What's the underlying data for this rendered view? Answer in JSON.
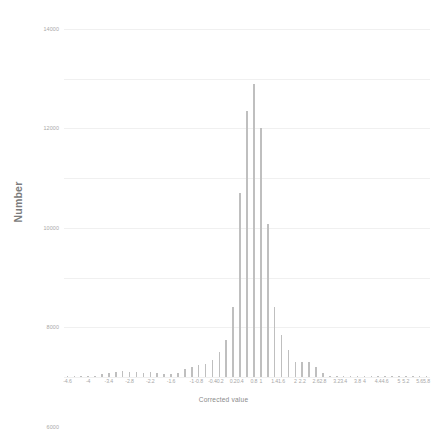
{
  "chart_data": {
    "type": "bar",
    "title": "",
    "subtitle": "",
    "xlabel": "Corrected value",
    "ylabel": "Number",
    "ylim": [
      0,
      14000
    ],
    "ytick_step": 2000,
    "yticks": [
      0,
      2000,
      4000,
      6000,
      8000,
      10000,
      12000,
      14000
    ],
    "ytick_labels": [
      "0",
      "2000",
      "4000",
      "6000",
      "8000",
      "10000",
      "12000",
      "14000"
    ],
    "xlim": [
      -4.6,
      5.8
    ],
    "grid": "horizontal",
    "legend": "none",
    "bar_color": "#bfbfbf",
    "grid_color": "#f0f0f0",
    "axis_text_color": "#a8a8a8",
    "background": "#ffffff",
    "categories": [
      "-4.6",
      "-4.4",
      "-4.2",
      "-4",
      "-3.8",
      "-3.6",
      "-3.4",
      "-3.2",
      "-3",
      "-2.8",
      "-2.6",
      "-2.4",
      "-2.2",
      "-2",
      "-1.8",
      "-1.6",
      "-1.4",
      "-1.2",
      "-1",
      "-0.8",
      "-0.6",
      "-0.4",
      "-0.2",
      "0",
      "0.2",
      "0.4",
      "0.6",
      "0.8",
      "1",
      "1.2",
      "1.4",
      "1.6",
      "1.8",
      "2",
      "2.2",
      "2.4",
      "2.6",
      "2.8",
      "3",
      "3.2",
      "3.4",
      "3.6",
      "3.8",
      "4",
      "4.2",
      "4.4",
      "4.6",
      "4.8",
      "5",
      "5.2",
      "5.4",
      "5.6",
      "5.8"
    ],
    "xtick_labels": [
      "-4.6",
      "",
      "",
      "-4",
      "",
      "",
      "-3.4",
      "",
      "",
      "-2.8",
      "",
      "",
      "-2.2",
      "",
      "",
      "-1.6",
      "",
      "",
      "-1",
      "-0.8",
      "",
      "-0.4",
      "-0.2",
      "",
      "0.2",
      "0.4",
      "",
      "0.8",
      "1",
      "",
      "1.4",
      "1.6",
      "",
      "2",
      "2.2",
      "",
      "2.6",
      "2.8",
      "",
      "3.2",
      "3.4",
      "",
      "3.8",
      "4",
      "",
      "4.4",
      "4.6",
      "",
      "5",
      "5.2",
      "",
      "5.6",
      "5.8"
    ],
    "values": [
      20,
      20,
      20,
      60,
      60,
      110,
      180,
      200,
      230,
      200,
      190,
      180,
      190,
      150,
      130,
      120,
      180,
      330,
      420,
      480,
      530,
      700,
      1000,
      1500,
      2800,
      7400,
      10700,
      11800,
      10000,
      6150,
      2800,
      1700,
      1100,
      620,
      600,
      620,
      400,
      180,
      60,
      30,
      20,
      10,
      8,
      6,
      5,
      4,
      3,
      2,
      2,
      1,
      1,
      1,
      1
    ],
    "peak": {
      "category": "0.8",
      "value": 11800
    }
  }
}
